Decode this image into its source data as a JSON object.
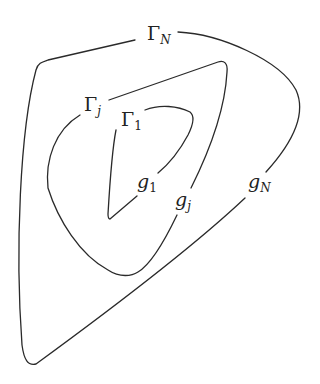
{
  "diagram": {
    "type": "nested closed curves",
    "curves": [
      {
        "id": "outer",
        "label": "Γ",
        "label_sub": "N",
        "point_label": "g",
        "point_sub": "N"
      },
      {
        "id": "middle",
        "label": "Γ",
        "label_sub": "j",
        "point_label": "g",
        "point_sub": "j"
      },
      {
        "id": "inner",
        "label": "Γ",
        "label_sub": "1",
        "point_label": "g",
        "point_sub": "1"
      }
    ],
    "stroke_color": "#2a2a2a",
    "background": "#ffffff"
  }
}
